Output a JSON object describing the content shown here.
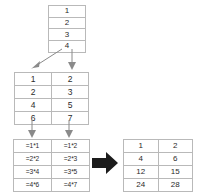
{
  "diagram": {
    "background_color": "#ffffff",
    "border_color": "#b9b9b9",
    "text_color": "#2b2b2b",
    "thin_arrow_color": "#8a8a8a",
    "block_arrow_color": "#1c1c1c"
  },
  "source_table": {
    "name": "source-column",
    "columns": 1,
    "rows": [
      [
        "1"
      ],
      [
        "2"
      ],
      [
        "3"
      ],
      [
        "4"
      ]
    ]
  },
  "operands_table": {
    "name": "operand-columns",
    "columns": 2,
    "rows": [
      [
        "1",
        "2"
      ],
      [
        "2",
        "3"
      ],
      [
        "4",
        "5"
      ],
      [
        "6",
        "7"
      ]
    ]
  },
  "formulas_table": {
    "name": "formula-cells",
    "columns": 2,
    "rows": [
      [
        "=1*1",
        "=1*2"
      ],
      [
        "=2*2",
        "=2*3"
      ],
      [
        "=3*4",
        "=3*5"
      ],
      [
        "=4*6",
        "=4*7"
      ]
    ]
  },
  "results_table": {
    "name": "result-values",
    "columns": 2,
    "rows": [
      [
        "1",
        "2"
      ],
      [
        "4",
        "6"
      ],
      [
        "12",
        "15"
      ],
      [
        "24",
        "28"
      ]
    ]
  },
  "arrows": {
    "split": {
      "name": "split-arrows",
      "count": 2,
      "description": "diagonal-down-left and straight-down"
    },
    "fill_down": {
      "name": "fill-down-arrows",
      "count": 2,
      "description": "two straight-down arrows"
    },
    "evaluate": {
      "name": "evaluate-arrow",
      "count": 1,
      "description": "thick right-pointing block arrow"
    }
  }
}
